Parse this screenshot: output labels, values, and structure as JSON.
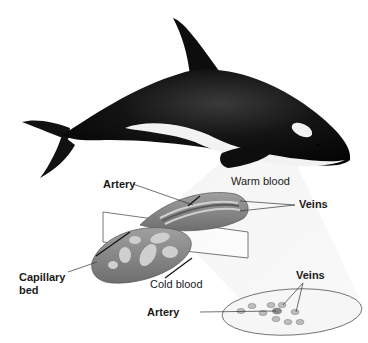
{
  "figure": {
    "labels": {
      "artery_top": "Artery",
      "warm_blood": "Warm blood",
      "veins_top": "Veins",
      "capillary_bed_line1": "Capillary",
      "capillary_bed_line2": "bed",
      "cold_blood": "Cold blood",
      "veins_bottom": "Veins",
      "artery_bottom": "Artery"
    },
    "colors": {
      "whale_body": "#111111",
      "whale_patch": "#f2f2f2",
      "flipper_tissue": "#8a8a8a",
      "vessel_light": "#c8c8c8",
      "light_beam": "#eeeeee"
    }
  }
}
